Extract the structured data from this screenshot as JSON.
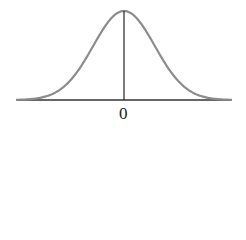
{
  "chart_data": {
    "type": "line",
    "title": "",
    "xlabel": "",
    "ylabel": "",
    "x_tick_labels": [
      "0"
    ],
    "series": [
      {
        "name": "normal density",
        "mean": 0,
        "x": [
          -3.5,
          -3,
          -2.5,
          -2,
          -1.5,
          -1,
          -0.5,
          0,
          0.5,
          1,
          1.5,
          2,
          2.5,
          3,
          3.5
        ],
        "values": [
          0.001,
          0.004,
          0.018,
          0.054,
          0.13,
          0.242,
          0.352,
          0.399,
          0.352,
          0.242,
          0.13,
          0.054,
          0.018,
          0.004,
          0.001
        ]
      }
    ],
    "annotations": [
      "vertical line at mean x=0"
    ],
    "grid": false,
    "legend": "none",
    "colors": {
      "curve": "#8c8c8c",
      "axis": "#333333",
      "mean_line": "#222222"
    }
  }
}
